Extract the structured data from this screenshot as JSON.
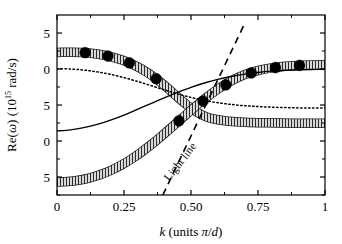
{
  "chart_data": {
    "type": "line",
    "title": "",
    "xlabel": "k (units π/d)",
    "ylabel": "Re(ω) (10¹⁵ rad/s)",
    "ylabel_parts": {
      "prefix": "Re(",
      "omega": "ω",
      "middle": ") (10",
      "exponent": "15",
      "suffix": " rad/s)"
    },
    "xlabel_parts": {
      "k": "k",
      "rest": " (units ",
      "pi": "π",
      "slash": "/",
      "d": "d",
      "close": ")"
    },
    "xlim": [
      0,
      1
    ],
    "ylim": [
      -17.5,
      7.5
    ],
    "xticks": [
      0,
      0.25,
      0.5,
      0.75,
      1
    ],
    "xtick_labels": [
      "0",
      "0.25",
      "0.50",
      "0.75",
      "1"
    ],
    "yticks": [
      5,
      0,
      -5,
      -10,
      -15
    ],
    "ytick_labels": [
      "5",
      "0",
      "5",
      "0",
      "5"
    ],
    "yticks_minor": [
      2.5,
      -2.5,
      -7.5,
      -12.5,
      -17.5
    ],
    "grid": false,
    "legend": null,
    "annotations": [
      {
        "name": "light-line-label",
        "text": "Light line",
        "x": 0.47,
        "y": -13.2,
        "rotation": -52
      }
    ],
    "series": [
      {
        "name": "upper-polariton-band",
        "style": "hatched-band",
        "points": [
          [
            0.0,
            2.3
          ],
          [
            0.03,
            2.32
          ],
          [
            0.06,
            2.33
          ],
          [
            0.09,
            2.3
          ],
          [
            0.12,
            2.22
          ],
          [
            0.15,
            2.08
          ],
          [
            0.18,
            1.88
          ],
          [
            0.21,
            1.62
          ],
          [
            0.24,
            1.28
          ],
          [
            0.27,
            0.85
          ],
          [
            0.3,
            0.32
          ],
          [
            0.33,
            -0.32
          ],
          [
            0.36,
            -1.08
          ],
          [
            0.39,
            -1.95
          ],
          [
            0.42,
            -2.9
          ],
          [
            0.45,
            -3.9
          ],
          [
            0.48,
            -4.85
          ],
          [
            0.51,
            -5.7
          ],
          [
            0.54,
            -6.35
          ],
          [
            0.57,
            -6.8
          ],
          [
            0.6,
            -7.05
          ],
          [
            0.64,
            -7.25
          ],
          [
            0.7,
            -7.4
          ],
          [
            0.78,
            -7.48
          ],
          [
            0.88,
            -7.52
          ],
          [
            1.0,
            -7.55
          ]
        ]
      },
      {
        "name": "lower-polariton-band",
        "style": "hatched-band",
        "points": [
          [
            0.0,
            -15.7
          ],
          [
            0.04,
            -15.62
          ],
          [
            0.08,
            -15.45
          ],
          [
            0.12,
            -15.15
          ],
          [
            0.16,
            -14.7
          ],
          [
            0.2,
            -14.1
          ],
          [
            0.24,
            -13.35
          ],
          [
            0.28,
            -12.45
          ],
          [
            0.32,
            -11.4
          ],
          [
            0.36,
            -10.25
          ],
          [
            0.4,
            -9.0
          ],
          [
            0.44,
            -7.7
          ],
          [
            0.48,
            -6.4
          ],
          [
            0.52,
            -5.1
          ],
          [
            0.56,
            -3.9
          ],
          [
            0.6,
            -2.8
          ],
          [
            0.64,
            -1.85
          ],
          [
            0.68,
            -1.1
          ],
          [
            0.72,
            -0.52
          ],
          [
            0.76,
            -0.12
          ],
          [
            0.8,
            0.15
          ],
          [
            0.85,
            0.38
          ],
          [
            0.9,
            0.5
          ],
          [
            0.95,
            0.57
          ],
          [
            1.0,
            0.6
          ]
        ]
      },
      {
        "name": "solid-curve-mid",
        "style": "solid",
        "points": [
          [
            0.0,
            -8.6
          ],
          [
            0.05,
            -8.45
          ],
          [
            0.1,
            -8.15
          ],
          [
            0.15,
            -7.7
          ],
          [
            0.2,
            -7.1
          ],
          [
            0.25,
            -6.4
          ],
          [
            0.3,
            -5.6
          ],
          [
            0.35,
            -4.8
          ],
          [
            0.4,
            -4.0
          ],
          [
            0.45,
            -3.25
          ],
          [
            0.5,
            -2.55
          ],
          [
            0.55,
            -1.95
          ],
          [
            0.6,
            -1.45
          ],
          [
            0.65,
            -1.05
          ],
          [
            0.7,
            -0.72
          ],
          [
            0.75,
            -0.48
          ],
          [
            0.8,
            -0.3
          ],
          [
            0.85,
            -0.18
          ],
          [
            0.9,
            -0.1
          ],
          [
            0.95,
            -0.06
          ],
          [
            1.0,
            -0.05
          ]
        ]
      },
      {
        "name": "dotted-curve",
        "style": "dotted",
        "points": [
          [
            0.0,
            0.05
          ],
          [
            0.05,
            0.0
          ],
          [
            0.1,
            -0.15
          ],
          [
            0.15,
            -0.4
          ],
          [
            0.2,
            -0.75
          ],
          [
            0.25,
            -1.2
          ],
          [
            0.3,
            -1.72
          ],
          [
            0.35,
            -2.3
          ],
          [
            0.4,
            -2.9
          ],
          [
            0.45,
            -3.45
          ],
          [
            0.5,
            -3.95
          ],
          [
            0.55,
            -4.35
          ],
          [
            0.6,
            -4.68
          ],
          [
            0.65,
            -4.92
          ],
          [
            0.7,
            -5.1
          ],
          [
            0.75,
            -5.22
          ],
          [
            0.8,
            -5.3
          ],
          [
            0.85,
            -5.36
          ],
          [
            0.9,
            -5.4
          ],
          [
            0.95,
            -5.42
          ],
          [
            1.0,
            -5.43
          ]
        ]
      },
      {
        "name": "light-line-dashed",
        "style": "dashed",
        "points": [
          [
            0.395,
            -17.5
          ],
          [
            0.7,
            6.3
          ]
        ]
      }
    ],
    "markers": [
      {
        "name": "upper-band-markers",
        "shape": "filled-circle",
        "points": [
          [
            0.105,
            2.27
          ],
          [
            0.19,
            1.8
          ],
          [
            0.27,
            0.85
          ],
          [
            0.37,
            -1.35
          ]
        ]
      },
      {
        "name": "lower-band-markers",
        "shape": "filled-circle",
        "points": [
          [
            0.455,
            -7.2
          ],
          [
            0.545,
            -4.45
          ],
          [
            0.63,
            -2.2
          ],
          [
            0.725,
            -0.55
          ],
          [
            0.815,
            0.2
          ],
          [
            0.905,
            0.5
          ]
        ]
      }
    ],
    "colors": {
      "axis": "#000000",
      "band_fill": "#cfcfcf",
      "band_edge": "#1a1a1a",
      "marker": "#000000",
      "solid": "#000000",
      "dotted": "#000000",
      "dashed": "#000000",
      "background": "#ffffff"
    }
  }
}
